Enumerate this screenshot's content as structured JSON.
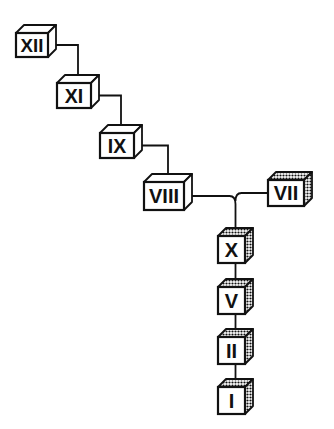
{
  "diagram": {
    "type": "tree-of-cubes",
    "colors": {
      "stroke": "#111111",
      "face": "#ffffff",
      "shade": "#555555"
    },
    "nodes": [
      {
        "id": "XII",
        "label": "XII",
        "x": 16,
        "y": 33,
        "w": 32,
        "h": 24,
        "shaded": false
      },
      {
        "id": "XI",
        "label": "XI",
        "x": 57,
        "y": 83,
        "w": 34,
        "h": 25,
        "shaded": false
      },
      {
        "id": "IX",
        "label": "IX",
        "x": 100,
        "y": 133,
        "w": 34,
        "h": 25,
        "shaded": false
      },
      {
        "id": "VIII",
        "label": "VIII",
        "x": 144,
        "y": 182,
        "w": 40,
        "h": 28,
        "shaded": false
      },
      {
        "id": "VII",
        "label": "VII",
        "x": 268,
        "y": 180,
        "w": 36,
        "h": 26,
        "shaded": true
      },
      {
        "id": "X",
        "label": "X",
        "x": 218,
        "y": 236,
        "w": 27,
        "h": 27,
        "shaded": true
      },
      {
        "id": "V",
        "label": "V",
        "x": 218,
        "y": 287,
        "w": 27,
        "h": 27,
        "shaded": true
      },
      {
        "id": "II",
        "label": "II",
        "x": 218,
        "y": 337,
        "w": 27,
        "h": 27,
        "shaded": true
      },
      {
        "id": "I",
        "label": "I",
        "x": 218,
        "y": 387,
        "w": 27,
        "h": 27,
        "shaded": true
      }
    ],
    "edges": [
      {
        "from": "XII",
        "to": "XI"
      },
      {
        "from": "XI",
        "to": "IX"
      },
      {
        "from": "IX",
        "to": "VIII"
      },
      {
        "from": "VIII",
        "to": "X"
      },
      {
        "from": "VII",
        "to": "X"
      },
      {
        "from": "X",
        "to": "V"
      },
      {
        "from": "V",
        "to": "II"
      },
      {
        "from": "II",
        "to": "I"
      }
    ]
  }
}
